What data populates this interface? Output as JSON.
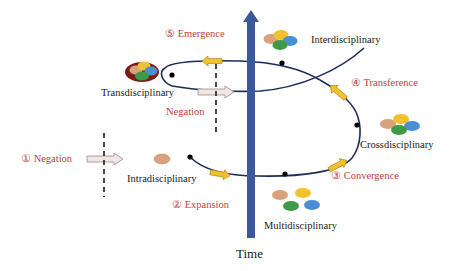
{
  "diagram": {
    "axis_label": "Time",
    "stages": [
      {
        "name": "Intradisciplinary"
      },
      {
        "name": "Multidisciplinary"
      },
      {
        "name": "Crossdisciplinary"
      },
      {
        "name": "Interdisciplinary"
      },
      {
        "name": "Transdisciplinary"
      }
    ],
    "processes": [
      {
        "label": "① Negation"
      },
      {
        "label": "② Expansion"
      },
      {
        "label": "③ Convergence"
      },
      {
        "label": "④ Transference"
      },
      {
        "label": "⑤ Emergence"
      },
      {
        "label": "Negation"
      }
    ],
    "colors": {
      "time_arrow": "#3a5a9c",
      "spiral": "#1c2a5c",
      "process_arrow": "#f2c12e",
      "process_arrow_outline": "#b08a1a",
      "negation_arrow": "#f1e6e2",
      "label_red": "#c0403a",
      "tan": "#d9a27a",
      "yellow": "#f2c12e",
      "green": "#3f9a47",
      "blue": "#4a8fd4",
      "dark_red": "#7a1a1a"
    }
  }
}
